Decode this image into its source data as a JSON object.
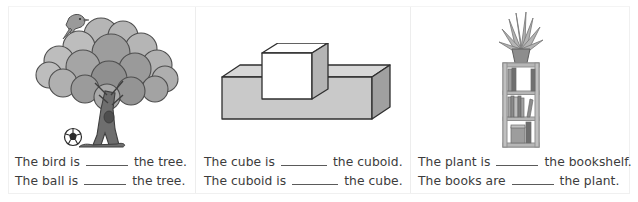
{
  "worksheet": {
    "title": "Prepositions of place fill-in-the-blank worksheet",
    "background_color": "#ffffff",
    "border_color": "#ededed",
    "text_color": "#3c3c3c",
    "blank_rule_color": "#5a5a5a"
  },
  "panels": [
    {
      "id": "panel-tree",
      "illustration": {
        "name": "tree-with-bird-and-ball-illustration",
        "objects": [
          "bird",
          "tree",
          "ball"
        ],
        "colors": {
          "foliage_light": "#b9b9b9",
          "foliage_mid": "#a0a0a0",
          "foliage_dark": "#8a8a8a",
          "trunk": "#6f6f6f",
          "outline": "#4a4a4a",
          "ball_white": "#ffffff",
          "ball_black": "#2b2b2b"
        }
      },
      "sentences": [
        {
          "before": "The bird is",
          "after": "the tree."
        },
        {
          "before": "The ball is",
          "after": "the tree."
        }
      ]
    },
    {
      "id": "panel-solids",
      "illustration": {
        "name": "cube-on-cuboid-illustration",
        "objects": [
          "cube",
          "cuboid"
        ],
        "colors": {
          "face_front": "#c9c9c9",
          "face_top": "#ffffff",
          "face_side": "#9e9e9e",
          "outline": "#2f2f2f"
        }
      },
      "sentences": [
        {
          "before": "The cube is",
          "after": "the cuboid."
        },
        {
          "before": "The cuboid is",
          "after": "the cube."
        }
      ]
    },
    {
      "id": "panel-bookshelf",
      "illustration": {
        "name": "bookshelf-with-plant-illustration",
        "objects": [
          "plant",
          "bookshelf",
          "books"
        ],
        "colors": {
          "shelf_frame": "#b0b0b0",
          "shelf_inner": "#ffffff",
          "book_dark": "#6d6d6d",
          "book_mid": "#9a9a9a",
          "book_light": "#c4c4c4",
          "plant_leaf": "#a8a8a8",
          "pot": "#8d8d8d"
        }
      },
      "sentences": [
        {
          "before": "The plant is",
          "after": "the bookshelf."
        },
        {
          "before": "The books are",
          "after": "the plant."
        }
      ]
    }
  ]
}
